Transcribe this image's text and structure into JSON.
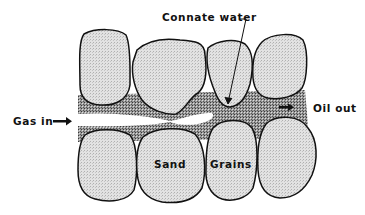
{
  "diagram": {
    "type": "cross-section schematic",
    "labels": {
      "connate_water": "Connate water",
      "gas_in": "Gas in",
      "oil_out": "Oil out",
      "sand": "Sand",
      "grains": "Grains"
    },
    "elements": {
      "upper_grains": 4,
      "lower_grains": 4,
      "pore_fluid": "oil (dark stipple)",
      "gas_channel": "white channel through center",
      "water_film": "black film coating grains"
    },
    "colors": {
      "grain_fill": "#d9d9d9",
      "oil_fill": "#8a8a8a",
      "outline": "#111111",
      "background": "#ffffff"
    }
  }
}
